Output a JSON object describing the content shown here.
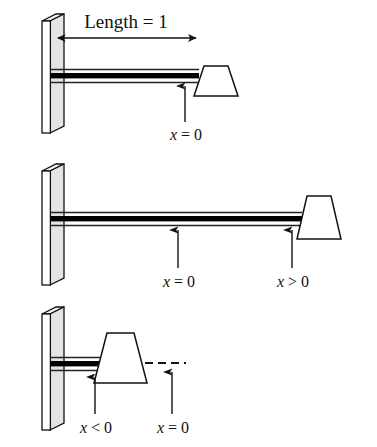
{
  "figure": {
    "type": "technical-diagram",
    "background_color": "#ffffff",
    "stroke_color": "#111111",
    "fill_color": "#ffffff",
    "beam_band_color": "#000000"
  },
  "dimension": {
    "label": "Length = 1",
    "label_text_plain": "Length = 1",
    "arrow_style": "double-headed"
  },
  "panels": [
    {
      "id": "panel-top",
      "index": 1,
      "block_position": "at-free-end",
      "labels": [
        {
          "id": "p1-x0",
          "prefix": "x",
          "relation": "=",
          "value": "0",
          "text": "x = 0"
        }
      ]
    },
    {
      "id": "panel-middle",
      "index": 2,
      "block_position": "beyond-free-end",
      "labels": [
        {
          "id": "p2-x0",
          "prefix": "x",
          "relation": "=",
          "value": "0",
          "text": "x = 0"
        },
        {
          "id": "p2-xgt0",
          "prefix": "x",
          "relation": ">",
          "value": "0",
          "text": "x > 0"
        }
      ]
    },
    {
      "id": "panel-bottom",
      "index": 3,
      "block_position": "near-wall",
      "has_dashed_reference_line": true,
      "labels": [
        {
          "id": "p3-xlt0",
          "prefix": "x",
          "relation": "<",
          "value": "0",
          "text": "x < 0"
        },
        {
          "id": "p3-x0",
          "prefix": "x",
          "relation": "=",
          "value": "0",
          "text": "x = 0"
        }
      ]
    }
  ],
  "elements": {
    "wall_name": "fixed support wall",
    "beam_name": "flexible beam",
    "block_name": "mass block",
    "arrow_name": "pointer arrow",
    "dashed_name": "reference datum line"
  }
}
